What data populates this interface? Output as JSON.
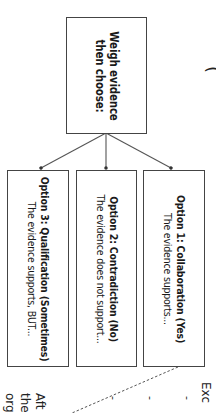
{
  "diagram": {
    "orientation": "rotated 90deg clockwise",
    "root": {
      "lines": [
        "Weigh evidence",
        "then choose:"
      ]
    },
    "options": [
      {
        "title": "Option 3: Qualification (Sometimes)",
        "desc": "The evidence supports, BUT..."
      },
      {
        "title": "Option 2: Contradiction (No)",
        "desc": "The evidence does not support..."
      },
      {
        "title": "Option 1: Collaboration (Yes)",
        "desc": "The evidence supports..."
      }
    ],
    "fragments": {
      "right_cut": "Exc",
      "bullets": [
        "-",
        "-",
        "-"
      ],
      "left_cut_lines": [
        "Aft",
        "the",
        "org"
      ],
      "edge_glyph": "("
    },
    "colors": {
      "stroke": "#444444",
      "text": "#1a1a1a",
      "background": "#ffffff"
    }
  }
}
